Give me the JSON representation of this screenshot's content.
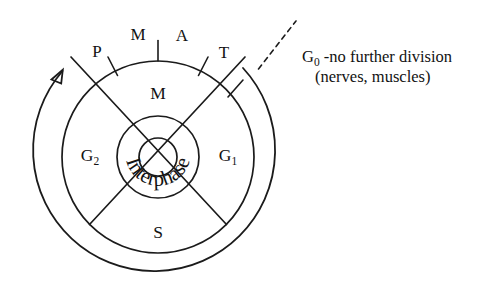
{
  "diagram": {
    "center": {
      "x": 158,
      "y": 157
    },
    "radii": {
      "inner_small": 19,
      "interphase_ring": 41,
      "middle": 96,
      "outer_arc": 121
    },
    "mitosis_stage_labels": [
      {
        "name": "prophase",
        "label": "P",
        "x": 97,
        "y": 53
      },
      {
        "name": "metaphase",
        "label": "M",
        "x": 138,
        "y": 36
      },
      {
        "name": "anaphase",
        "label": "A",
        "x": 182,
        "y": 37
      },
      {
        "name": "telophase",
        "label": "T",
        "x": 224,
        "y": 54
      }
    ],
    "quadrant_labels": [
      {
        "name": "m-phase",
        "label": "M",
        "sub": "",
        "x": 158,
        "y": 95
      },
      {
        "name": "g1-phase",
        "label": "G",
        "sub": "1",
        "x": 228,
        "y": 157
      },
      {
        "name": "s-phase",
        "label": "S",
        "sub": "",
        "x": 158,
        "y": 234
      },
      {
        "name": "g2-phase",
        "label": "G",
        "sub": "2",
        "x": 90,
        "y": 157
      }
    ],
    "inner_ring_label": "Interphase",
    "g0_annotation": {
      "label": "G",
      "sub": "0",
      "line1_rest": " -no further division",
      "line2": "(nerves, muscles)",
      "x": 302,
      "y": 58
    },
    "cycle_arrow": {
      "name": "cycle-direction-arrow",
      "description": "outer arrow arc indicating cycle progression"
    },
    "colors": {
      "stroke": "#1b1b1b",
      "text": "#121212",
      "background": "#ffffff"
    }
  }
}
